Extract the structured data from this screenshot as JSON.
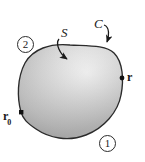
{
  "figure": {
    "kind": "surface-boundary-diagram",
    "background_color": "#ffffff",
    "outline_color": "#2b2b2b",
    "fill_light": "#f2f2f2",
    "fill_mid": "#c8c8c8",
    "fill_dark": "#9a9a9a",
    "labels": {
      "surface": "S",
      "curve": "C",
      "position_vector": "r",
      "reference_point": "r",
      "reference_point_subscript": "0",
      "region_outer": "1",
      "region_inner": "2"
    },
    "markers": {
      "point_r_shape": "dot",
      "point_r0_shape": "square"
    },
    "annotations": {
      "arrow_from_S_target": "surface-interior",
      "arrow_from_C_target": "boundary-curve"
    }
  }
}
